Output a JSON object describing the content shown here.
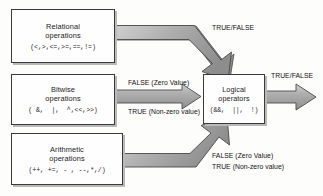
{
  "diagram": {
    "colors": {
      "arrow_fill": "#a9a9a9",
      "arrow_fill_light": "#c8c8c8",
      "arrow_stroke": "#4a4a4a",
      "box_border": "#3a3a3a",
      "box_shadow": "#b9b9b9",
      "box_fill": "#fefefe",
      "text": "#1a1a1a",
      "background": "#fdfdfc"
    },
    "boxes": [
      {
        "id": "relational",
        "title_line1": "Relational",
        "title_line2": "operations",
        "symbols": "(<,>,<=,>=,==,!=)"
      },
      {
        "id": "bitwise",
        "title_line1": "Bitwise",
        "title_line2": "operations",
        "symbols": "( &,  |,  ^,<<,>>)"
      },
      {
        "id": "arithmetic",
        "title_line1": "Arithmetic",
        "title_line2": "operations",
        "symbols": "(++, +=, - , --,*,/)"
      },
      {
        "id": "logical",
        "title_line1": "Logical",
        "title_line2": "operators",
        "symbols": "(&&,  ||,  !)"
      }
    ],
    "arrow_labels": {
      "top_true_false": "TRUE/FALSE",
      "output_true_false": "TRUE/FALSE",
      "middle_false": "FALSE (Zero Value)",
      "middle_true": "TRUE (Non-zero value)",
      "bottom_false": "FALSE (Zero Value)",
      "bottom_true": "TRUE (Non-zero value)"
    },
    "arrows": [
      {
        "id": "relational-to-logical",
        "from": "relational",
        "to": "logical",
        "shape": "elbow-down-right",
        "label": "TRUE/FALSE"
      },
      {
        "id": "bitwise-to-logical",
        "from": "bitwise",
        "to": "logical",
        "shape": "straight-right",
        "labels": [
          "FALSE (Zero Value)",
          "TRUE (Non-zero value)"
        ]
      },
      {
        "id": "arithmetic-to-logical",
        "from": "arithmetic",
        "to": "logical",
        "shape": "elbow-up-right",
        "labels": [
          "FALSE (Zero Value)",
          "TRUE (Non-zero value)"
        ]
      },
      {
        "id": "logical-output",
        "from": "logical",
        "to": "output",
        "shape": "straight-right",
        "label": "TRUE/FALSE"
      }
    ]
  }
}
